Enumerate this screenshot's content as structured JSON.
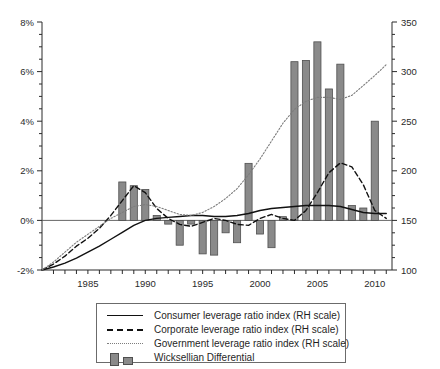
{
  "chart_data": {
    "type": "bar",
    "title": "",
    "subtitle": "",
    "xlabel": "",
    "ylabel": "",
    "ylabel_right": "",
    "grid": false,
    "legend_position": "bottom",
    "xlim": [
      1981,
      2011.5
    ],
    "xticks": [
      1985,
      1990,
      1995,
      2000,
      2005,
      2010
    ],
    "xtick_labels": [
      "1985",
      "1990",
      "1995",
      "2000",
      "2005",
      "2010"
    ],
    "xticks_minor_every": 1,
    "ylim_left": [
      -2,
      8
    ],
    "yticks_left": [
      -2,
      0,
      2,
      4,
      6,
      8
    ],
    "ytick_labels_left": [
      "-2%",
      "0%",
      "2%",
      "4%",
      "6%",
      "8%"
    ],
    "ylim_right": [
      100,
      350
    ],
    "yticks_right": [
      100,
      150,
      200,
      250,
      300,
      350
    ],
    "ytick_labels_right": [
      "100",
      "150",
      "200",
      "250",
      "300",
      "350"
    ],
    "bar_series": {
      "name": "Wicksellian Differential",
      "axis": "left",
      "unit": "%",
      "color": "#8a8a8a",
      "edge_color": "#4f4f4f",
      "x": [
        1988,
        1989,
        1990,
        1991,
        1992,
        1993,
        1994,
        1995,
        1996,
        1997,
        1998,
        1999,
        2000,
        2001,
        2002,
        2003,
        2004,
        2005,
        2006,
        2007,
        2008,
        2009,
        2010
      ],
      "values": [
        1.55,
        1.4,
        1.25,
        0.2,
        -0.15,
        -1.0,
        -0.15,
        -1.35,
        -1.4,
        -0.5,
        -0.9,
        2.3,
        -0.55,
        -1.1,
        0.15,
        6.4,
        6.45,
        7.2,
        5.3,
        6.3,
        0.6,
        0.5,
        4.0
      ]
    },
    "series": [
      {
        "name": "Consumer leverage ratio index (RH scale)",
        "axis": "right",
        "style": "solid",
        "color": "#111111",
        "x": [
          1981,
          1982,
          1983,
          1984,
          1985,
          1986,
          1987,
          1988,
          1989,
          1990,
          1991,
          1992,
          1993,
          1994,
          1995,
          1996,
          1997,
          1998,
          1999,
          2000,
          2001,
          2002,
          2003,
          2004,
          2005,
          2006,
          2007,
          2008,
          2009,
          2010,
          2011
        ],
        "values": [
          100,
          103,
          107,
          112,
          118,
          124,
          131,
          138,
          145,
          150,
          152,
          153,
          154,
          155,
          155,
          154,
          154,
          155,
          157,
          160,
          162,
          163,
          164,
          165,
          165,
          165,
          164,
          161,
          158,
          157,
          157
        ]
      },
      {
        "name": "Corporate leverage ratio index (RH scale)",
        "axis": "right",
        "style": "dashed",
        "color": "#111111",
        "x": [
          1981,
          1982,
          1983,
          1984,
          1985,
          1986,
          1987,
          1988,
          1989,
          1990,
          1991,
          1992,
          1993,
          1994,
          1995,
          1996,
          1997,
          1998,
          1999,
          2000,
          2001,
          2002,
          2003,
          2004,
          2005,
          2006,
          2007,
          2008,
          2009,
          2010,
          2011
        ],
        "values": [
          100,
          106,
          114,
          124,
          132,
          142,
          155,
          170,
          185,
          178,
          162,
          152,
          146,
          144,
          148,
          152,
          150,
          146,
          145,
          152,
          156,
          152,
          150,
          160,
          178,
          198,
          208,
          204,
          186,
          160,
          152
        ]
      },
      {
        "name": "Government leverage ratio index (RH scale)",
        "axis": "right",
        "style": "dotted",
        "color": "#7d7d7d",
        "x": [
          1981,
          1982,
          1983,
          1984,
          1985,
          1986,
          1987,
          1988,
          1989,
          1990,
          1991,
          1992,
          1993,
          1994,
          1995,
          1996,
          1997,
          1998,
          1999,
          2000,
          2001,
          2002,
          2003,
          2004,
          2005,
          2006,
          2007,
          2008,
          2009,
          2010,
          2011
        ],
        "values": [
          100,
          108,
          118,
          128,
          136,
          144,
          152,
          158,
          164,
          166,
          164,
          160,
          156,
          155,
          158,
          164,
          172,
          182,
          196,
          212,
          230,
          248,
          262,
          270,
          274,
          274,
          272,
          276,
          286,
          296,
          307
        ]
      }
    ]
  },
  "legend": {
    "items": [
      {
        "label": "Consumer leverage ratio index (RH scale)",
        "key": "solid-line-key"
      },
      {
        "label": "Corporate leverage ratio index (RH scale)",
        "key": "dashed-line-key"
      },
      {
        "label": "Government leverage ratio index (RH scale)",
        "key": "dotted-line-key"
      },
      {
        "label": "Wicksellian Differential",
        "key": "bar-swatch-key"
      }
    ]
  }
}
